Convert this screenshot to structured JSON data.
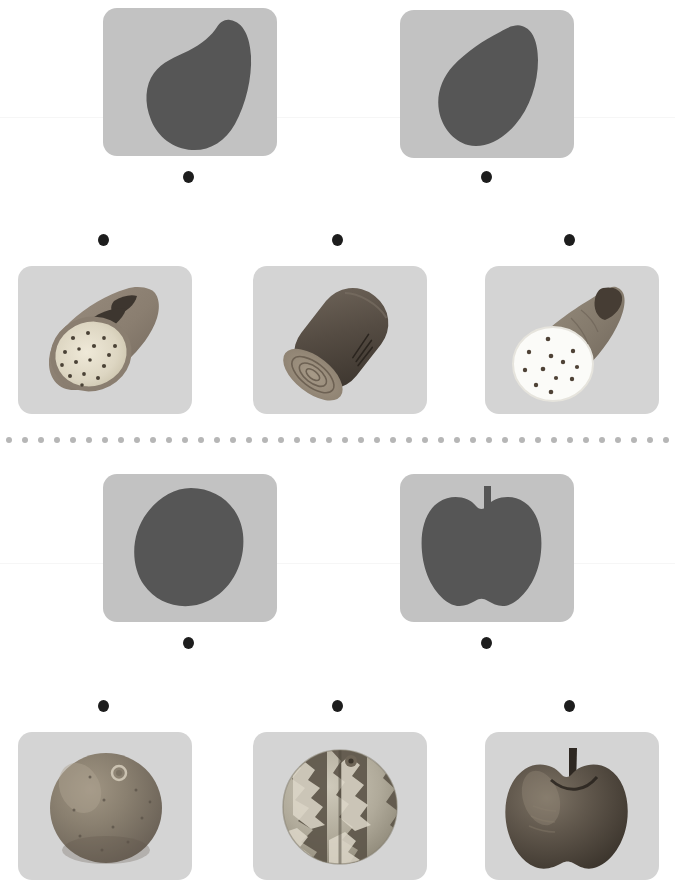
{
  "board": {
    "title": "Fruit and Vegetable Matching Board",
    "background_color": "#ffffff",
    "card_color": "#c9c9c9",
    "dot_color": "#1d1d1d",
    "divider_color": "#b6b6b6",
    "silhouette_color": "#555555",
    "width": 675,
    "height": 887
  },
  "divider": {
    "name": "dotted-divider",
    "y": 437,
    "dot_count": 42,
    "dot_diameter": 6,
    "color": "#b6b6b6"
  },
  "sections": [
    {
      "id": "section-vegetables",
      "label": "Root vegetable matching section",
      "silhouette_row": {
        "label": "Silhouette prompts",
        "cards": [
          {
            "name": "silhouette-card-sweet-potato",
            "item": "sweet potato silhouette",
            "x": 103,
            "y": 8,
            "w": 174,
            "h": 148,
            "fill": "#565656",
            "shape": "sweet-potato"
          },
          {
            "name": "silhouette-card-yam",
            "item": "yam silhouette",
            "x": 400,
            "y": 10,
            "w": 174,
            "h": 148,
            "fill": "#565656",
            "shape": "yam"
          }
        ],
        "dots": [
          {
            "name": "connector-dot-sweet-potato",
            "x": 183,
            "y": 171
          },
          {
            "name": "connector-dot-yam",
            "x": 481,
            "y": 171
          }
        ]
      },
      "photo_row": {
        "label": "Photograph answers",
        "dots": [
          {
            "name": "connector-dot-photo-sweet-potato",
            "x": 98,
            "y": 234
          },
          {
            "name": "connector-dot-photo-cassava",
            "x": 332,
            "y": 234
          },
          {
            "name": "connector-dot-photo-taro",
            "x": 564,
            "y": 234
          }
        ],
        "cards": [
          {
            "name": "photo-card-sweet-potato",
            "item": "sliced sweet potato with speckled cream flesh",
            "x": 18,
            "y": 266,
            "w": 174,
            "h": 148,
            "art": "sweet-potato-cut"
          },
          {
            "name": "photo-card-cassava",
            "item": "cassava root cross section",
            "x": 253,
            "y": 266,
            "w": 174,
            "h": 148,
            "art": "cassava-log"
          },
          {
            "name": "photo-card-taro",
            "item": "taro root with white speckled flesh",
            "x": 485,
            "y": 266,
            "w": 174,
            "h": 148,
            "art": "taro-cut"
          }
        ]
      }
    },
    {
      "id": "section-fruits",
      "label": "Round fruit matching section",
      "silhouette_row": {
        "label": "Silhouette prompts",
        "cards": [
          {
            "name": "silhouette-card-orange",
            "item": "round fruit silhouette",
            "x": 103,
            "y": 474,
            "w": 174,
            "h": 148,
            "fill": "#565656",
            "shape": "round-fruit"
          },
          {
            "name": "silhouette-card-apple",
            "item": "apple silhouette",
            "x": 400,
            "y": 474,
            "w": 174,
            "h": 148,
            "fill": "#565656",
            "shape": "apple"
          }
        ],
        "dots": [
          {
            "name": "connector-dot-orange",
            "x": 183,
            "y": 637
          },
          {
            "name": "connector-dot-apple",
            "x": 481,
            "y": 637
          }
        ]
      },
      "photo_row": {
        "label": "Photograph answers",
        "dots": [
          {
            "name": "connector-dot-photo-orange",
            "x": 98,
            "y": 700
          },
          {
            "name": "connector-dot-photo-watermelon",
            "x": 332,
            "y": 700
          },
          {
            "name": "connector-dot-photo-apple",
            "x": 564,
            "y": 700
          }
        ],
        "cards": [
          {
            "name": "photo-card-orange",
            "item": "whole orange citrus fruit",
            "x": 18,
            "y": 732,
            "w": 174,
            "h": 148,
            "art": "orange-fruit"
          },
          {
            "name": "photo-card-watermelon",
            "item": "round camouflage patterned watermelon",
            "x": 253,
            "y": 732,
            "w": 174,
            "h": 148,
            "art": "watermelon"
          },
          {
            "name": "photo-card-apple",
            "item": "red apple with stem",
            "x": 485,
            "y": 732,
            "w": 174,
            "h": 148,
            "art": "apple-fruit"
          }
        ]
      }
    }
  ],
  "seams": [
    {
      "name": "paper-seam-top",
      "y": 117
    },
    {
      "name": "paper-seam-bottom",
      "y": 563
    }
  ]
}
